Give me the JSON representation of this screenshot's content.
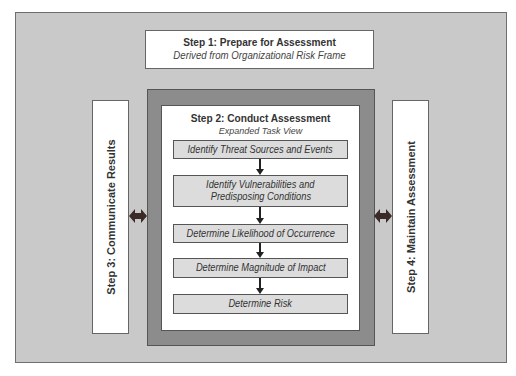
{
  "diagram": {
    "step1": {
      "title": "Step 1: Prepare for Assessment",
      "subtitle": "Derived from Organizational Risk Frame"
    },
    "step2": {
      "title": "Step 2: Conduct Assessment",
      "subtitle": "Expanded Task View",
      "tasks": [
        {
          "label": "Identify Threat Sources and Events"
        },
        {
          "label_line1": "Identify Vulnerabilities and",
          "label_line2": "Predisposing Conditions"
        },
        {
          "label": "Determine Likelihood of Occurrence"
        },
        {
          "label": "Determine Magnitude of Impact"
        },
        {
          "label": "Determine Risk"
        }
      ]
    },
    "step3": {
      "title": "Step 3: Communicate Results"
    },
    "step4": {
      "title": "Step 4: Maintain Assessment"
    },
    "colors": {
      "background": "#c9c9c9",
      "frame": "#8c8c8c",
      "task_fill": "#dcdcdc",
      "arrow": "#3a2a28"
    }
  }
}
